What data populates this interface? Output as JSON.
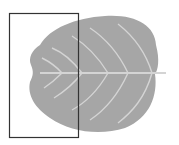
{
  "diagram": {
    "colors": {
      "background": "#ffffff",
      "leaf_fill": "#a6a6a6",
      "vein": "#d4d4d4",
      "frame_stroke": "#333333"
    },
    "highlight_rect": {
      "x": 9,
      "y": 13,
      "width": 69,
      "height": 124
    }
  }
}
